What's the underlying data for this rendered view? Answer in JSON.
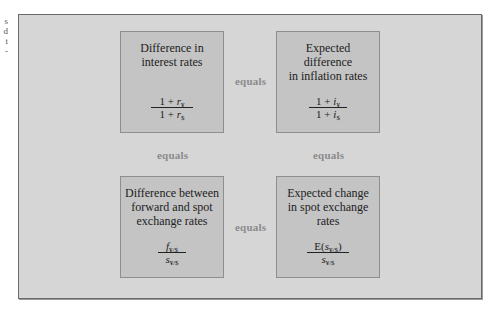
{
  "edge_fragments": [
    "s",
    "d",
    "t",
    "-"
  ],
  "diagram": {
    "boxes": [
      {
        "id": "interest-rates",
        "title_lines": [
          "Difference in",
          "interest rates"
        ],
        "numerator": {
          "prefix": "1 + ",
          "var": "r",
          "sub": "¥"
        },
        "denominator": {
          "prefix": "1 + ",
          "var": "r",
          "sub": "$"
        }
      },
      {
        "id": "inflation-rates",
        "title_lines": [
          "Expected",
          "difference",
          "in inflation rates"
        ],
        "numerator": {
          "prefix": "1 + ",
          "var": "i",
          "sub": "¥"
        },
        "denominator": {
          "prefix": "1 + ",
          "var": "i",
          "sub": "$"
        }
      },
      {
        "id": "forward-spot",
        "title_lines": [
          "Difference between",
          "forward and spot",
          "exchange rates"
        ],
        "numerator": {
          "prefix": "",
          "var": "f",
          "sub": "¥/$"
        },
        "denominator": {
          "prefix": "",
          "var": "s",
          "sub": "¥/$"
        }
      },
      {
        "id": "expected-spot-change",
        "title_lines": [
          "Expected change",
          "in spot exchange",
          "rates"
        ],
        "numerator": {
          "prefix": "E(",
          "var": "s",
          "sub": "¥/$",
          "suffix": ")"
        },
        "denominator": {
          "prefix": "",
          "var": "s",
          "sub": "¥/$"
        }
      }
    ],
    "connectors": {
      "top": "equals",
      "bottom": "equals",
      "left": "equals",
      "right": "equals"
    }
  },
  "colors": {
    "frame_bg": "#d6d6d6",
    "box_bg": "#c4c4c4",
    "connector_text": "#8a8a8a"
  }
}
